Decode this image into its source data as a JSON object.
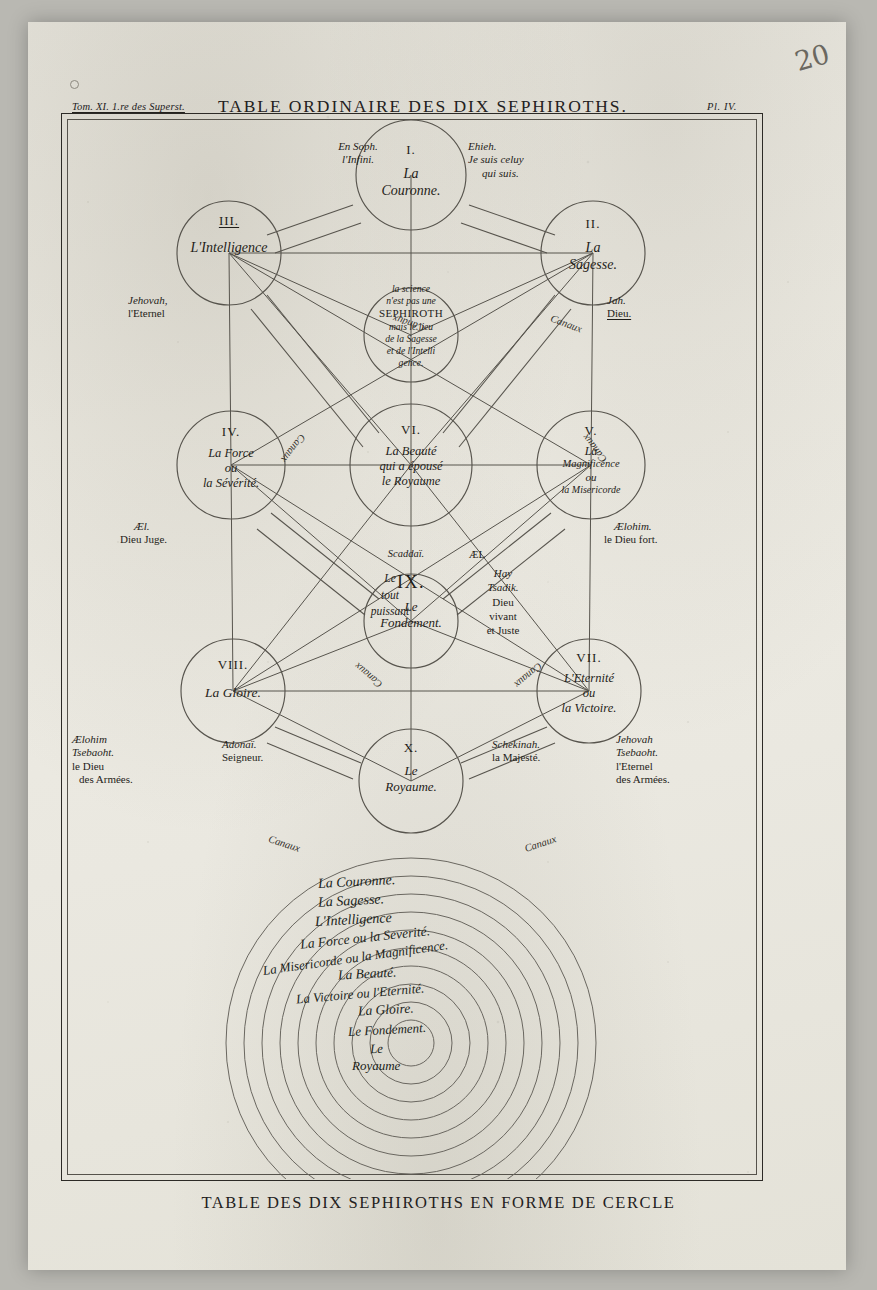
{
  "page": {
    "tome_line": "Tom. XI. 1.re des Superst.",
    "title": "TABLE ORDINAIRE DES DIX SEPHIROTHS.",
    "plate_number": "Pl. IV.",
    "pen_annotation": "20",
    "bottom_caption": "TABLE DES DIX SEPHIROTHS EN FORME DE CERCLE"
  },
  "daath": {
    "lines": [
      "la science",
      "n'est pas une",
      "SEPHIROTH",
      "mais le lieu",
      "de la Sagesse",
      "et de l'Intelli",
      "gence."
    ]
  },
  "sephiroth": [
    {
      "numeral": "I.",
      "name_lines": [
        "La",
        "Couronne."
      ]
    },
    {
      "numeral": "II.",
      "name_lines": [
        "La",
        "Sagesse."
      ]
    },
    {
      "numeral": "III.",
      "name_lines": [
        "L'Intelligence"
      ]
    },
    {
      "numeral": "IV.",
      "name_lines": [
        "La Force",
        "ou",
        "la Sévérité."
      ]
    },
    {
      "numeral": "V.",
      "name_lines": [
        "La",
        "Magnificence",
        "ou",
        "la Misericorde"
      ]
    },
    {
      "numeral": "VI.",
      "name_lines": [
        "La Beauté",
        "qui a épousé",
        "le Royaume"
      ]
    },
    {
      "numeral": "VII.",
      "name_lines": [
        "L'Eternité",
        "ou",
        "la Victoire."
      ]
    },
    {
      "numeral": "VIII.",
      "name_lines": [
        "La Gloire."
      ]
    },
    {
      "numeral": "IX.",
      "name_lines": [
        "Le",
        "Fondement."
      ]
    },
    {
      "numeral": "X.",
      "name_lines": [
        "Le",
        "Royaume."
      ]
    }
  ],
  "divine_names": {
    "ensoph": [
      "En Soph.",
      "l'Infini."
    ],
    "ehieh": [
      "Ehieh.",
      "Je suis celuy",
      "qui suis."
    ],
    "jehovah": [
      "Jehovah,",
      "l'Eternel"
    ],
    "jah": [
      "Jah.",
      "Dieu."
    ],
    "ael": [
      "Æl.",
      "Dieu Juge."
    ],
    "aelohim": [
      "Ælohim.",
      "le Dieu fort."
    ],
    "scaddai": [
      "Scaddaï.",
      "Le",
      "tout",
      "puissant"
    ],
    "hay_tsadik": [
      "ÆL",
      "Hay",
      "Tsadik.",
      "Dieu",
      "vivant",
      "et Juste"
    ],
    "aelohim_tsebaoht": [
      "Ælohim",
      "Tsebaoht.",
      "le Dieu",
      "des Armées."
    ],
    "adonai": [
      "Adonaï.",
      "Seigneur."
    ],
    "schekinah": [
      "Schekinah.",
      "la Majesté."
    ],
    "jehovah_tsebaoht": [
      "Jehovah",
      "Tsebaoht.",
      "l'Eternel",
      "des Armées."
    ]
  },
  "canaux_label": "Canaux",
  "circle_diagram": {
    "rings_outer_to_inner": [
      "La Couronne.",
      "La Sagesse.",
      "L'Intelligence",
      "La Force ou la Severité.",
      "La Misericorde ou la Magnificence.",
      "La Beauté.",
      "La Victoire ou l'Eternité.",
      "La Gloire.",
      "Le Fondement.",
      "Le Royaume"
    ]
  }
}
